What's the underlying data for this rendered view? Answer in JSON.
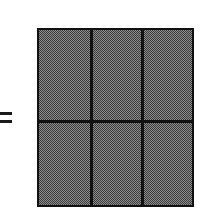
{
  "figure": {
    "background_color": "#ffffff",
    "ink_color": "#111111",
    "fill_color": "#8a8a8a",
    "fill_pattern": "50-percent-checkerboard-dither"
  },
  "equals": {
    "symbol": "=",
    "name": "equals-sign",
    "bar_count": 2,
    "color": "#1a1a1a",
    "x": 0,
    "y": 111,
    "width": 12,
    "height": 14
  },
  "rectangle": {
    "name": "shaded-rectangle",
    "x": 37,
    "y": 28,
    "width": 157,
    "height": 179,
    "border_width": 2,
    "border_color": "#111111",
    "columns": 3,
    "rows": 2,
    "total_cells": 6,
    "vertical_dividers_x": [
      51,
      102
    ],
    "horizontal_dividers_y": [
      90
    ],
    "cells": [
      {
        "id": "r1c1",
        "row": 1,
        "col": 1,
        "shaded": true
      },
      {
        "id": "r1c2",
        "row": 1,
        "col": 2,
        "shaded": true
      },
      {
        "id": "r1c3",
        "row": 1,
        "col": 3,
        "shaded": true
      },
      {
        "id": "r2c1",
        "row": 2,
        "col": 1,
        "shaded": true
      },
      {
        "id": "r2c2",
        "row": 2,
        "col": 2,
        "shaded": true
      },
      {
        "id": "r2c3",
        "row": 2,
        "col": 3,
        "shaded": true
      }
    ]
  }
}
